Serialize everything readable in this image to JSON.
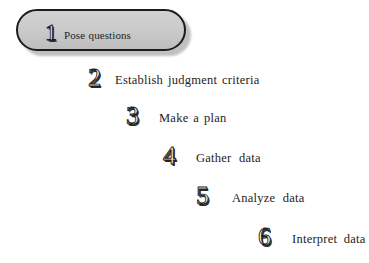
{
  "figure": {
    "background_color": "#ffffff"
  },
  "callout": {
    "shape": "rounded-rectangle",
    "fill_color": "#c9c9c9",
    "border_color": "#1c1c1c",
    "shadow_color": "#8e8e8e"
  },
  "steps": [
    {
      "number": "1",
      "label": "Pose questions",
      "highlighted": "true"
    },
    {
      "number": "2",
      "label": "Establish judgment criteria",
      "highlighted": "false"
    },
    {
      "number": "3",
      "label": "Make a plan",
      "highlighted": "false"
    },
    {
      "number": "4",
      "label": "Gather  data",
      "highlighted": "false"
    },
    {
      "number": "5",
      "label": "Analyze  data",
      "highlighted": "false"
    },
    {
      "number": "6",
      "label": "Interpret  data",
      "highlighted": "false"
    }
  ]
}
